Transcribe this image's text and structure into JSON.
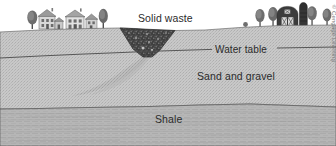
{
  "figure": {
    "credit": "© Cengage Learning",
    "background_color": "#ffffff"
  },
  "labels": {
    "solid_waste": "Solid waste",
    "water_table": "Water table",
    "sand_and_gravel": "Sand and gravel",
    "shale": "Shale"
  },
  "layers": [
    {
      "name": "sand-and-gravel",
      "label": "Sand and gravel",
      "color": "#c6c6c6",
      "texture": "stipple"
    },
    {
      "name": "shale",
      "label": "Shale",
      "color": "#b4b4b4",
      "texture": "horizontal-bedding-lines"
    }
  ],
  "features": {
    "solid_waste_pit": {
      "label": "Solid waste",
      "color": "#3d3d3d",
      "shape": "inverted-trapezoid"
    },
    "water_table": {
      "label": "Water table",
      "color": "#4a4a4a",
      "style": "solid-line"
    },
    "contaminant_plume": {
      "color": "#b0b0b0",
      "direction": "down-left"
    }
  },
  "scenery": {
    "left_group": {
      "name": "houses-and-trees",
      "houses": 3,
      "trees": 2
    },
    "right_group": {
      "name": "barn-silo-and-trees",
      "barn_door_marking": "XX",
      "silo": 1,
      "trees": 4,
      "shrubs": 1
    }
  },
  "colors": {
    "sky": "#ffffff",
    "sand": "#c6c6c6",
    "shale": "#b4b4b4",
    "waste": "#3d3d3d",
    "line": "#4a4a4a",
    "text": "#2b2b2b",
    "credit_text": "#7a7a7a"
  }
}
